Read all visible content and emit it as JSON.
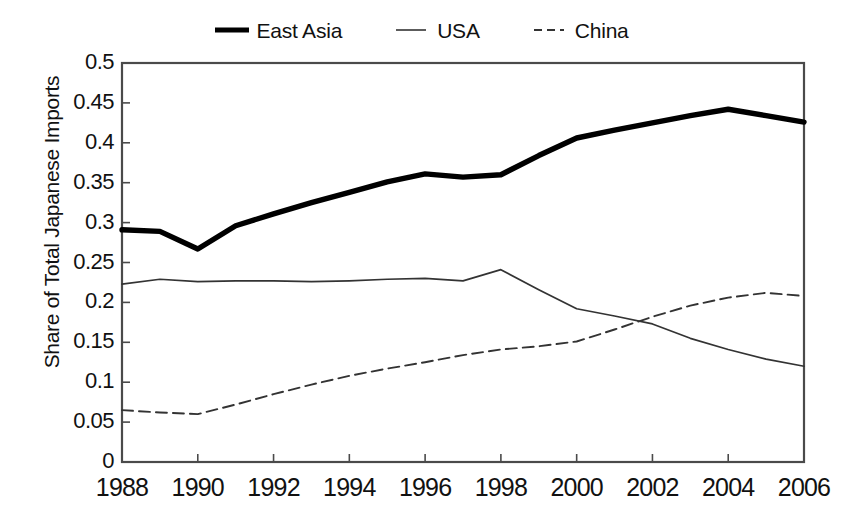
{
  "chart_data": {
    "type": "line",
    "title": "",
    "xlabel": "",
    "ylabel": "Share of Total Japanese Imports",
    "xlim": [
      1988,
      2006
    ],
    "ylim": [
      0,
      0.5
    ],
    "grid": false,
    "legend_position": "top-center",
    "x": [
      1988,
      1989,
      1990,
      1991,
      1992,
      1993,
      1994,
      1995,
      1996,
      1997,
      1998,
      1999,
      2000,
      2001,
      2002,
      2003,
      2004,
      2005,
      2006
    ],
    "xtick_labels": [
      "1988",
      "1990",
      "1992",
      "1994",
      "1996",
      "1998",
      "2000",
      "2002",
      "2004",
      "2006"
    ],
    "xtick_values": [
      1988,
      1990,
      1992,
      1994,
      1996,
      1998,
      2000,
      2002,
      2004,
      2006
    ],
    "ytick_labels": [
      "0.5",
      "0.45",
      "0.4",
      "0.35",
      "0.3",
      "0.25",
      "0.2",
      "0.15",
      "0.1",
      "0.05",
      "0"
    ],
    "ytick_values": [
      0.5,
      0.45,
      0.4,
      0.35,
      0.3,
      0.25,
      0.2,
      0.15,
      0.1,
      0.05,
      0
    ],
    "series": [
      {
        "name": "East Asia",
        "style": "solid-thick",
        "color": "#000000",
        "values": [
          0.291,
          0.289,
          0.267,
          0.296,
          0.311,
          0.325,
          0.338,
          0.351,
          0.361,
          0.357,
          0.36,
          0.384,
          0.406,
          0.416,
          0.425,
          0.434,
          0.442,
          0.434,
          0.426
        ]
      },
      {
        "name": "USA",
        "style": "solid-thin",
        "color": "#333333",
        "values": [
          0.223,
          0.229,
          0.226,
          0.227,
          0.227,
          0.226,
          0.227,
          0.229,
          0.23,
          0.227,
          0.241,
          0.216,
          0.192,
          0.183,
          0.173,
          0.155,
          0.141,
          0.129,
          0.12
        ]
      },
      {
        "name": "China",
        "style": "dashed",
        "color": "#333333",
        "values": [
          0.065,
          0.062,
          0.06,
          0.072,
          0.085,
          0.097,
          0.108,
          0.117,
          0.125,
          0.134,
          0.141,
          0.145,
          0.151,
          0.166,
          0.182,
          0.196,
          0.206,
          0.212,
          0.208
        ]
      }
    ]
  },
  "legend": {
    "entries": [
      {
        "label": "East Asia",
        "swatch": "thick-solid-line-icon"
      },
      {
        "label": "USA",
        "swatch": "thin-solid-line-icon"
      },
      {
        "label": "China",
        "swatch": "dashed-line-icon"
      }
    ]
  },
  "axes": {
    "y_title": "Share of Total Japanese Imports"
  }
}
